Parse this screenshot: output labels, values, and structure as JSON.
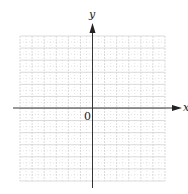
{
  "diagram": {
    "type": "coordinate-plane",
    "x_axis_label": "x",
    "y_axis_label": "y",
    "origin_label": "0",
    "grid": {
      "columns": 12,
      "rows": 12,
      "major_line_style": "solid-light",
      "minor_line_style": "dotted",
      "line_color": "#cccccc",
      "minor_color": "#d8d8d8"
    },
    "axis_color": "#333333"
  }
}
